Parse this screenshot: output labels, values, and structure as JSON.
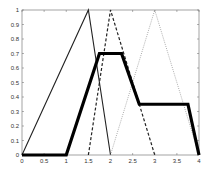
{
  "chart_data": {
    "type": "line",
    "title": "",
    "xlabel": "",
    "ylabel": "",
    "xlim": [
      0,
      4
    ],
    "ylim": [
      0,
      1
    ],
    "grid": false,
    "legend": null,
    "x_ticks": [
      "0",
      "0.5",
      "1",
      "1.5",
      "2",
      "2.5",
      "3",
      "3.5",
      "4"
    ],
    "y_ticks": [
      "0",
      "0.1",
      "0.2",
      "0.3",
      "0.4",
      "0.5",
      "0.6",
      "0.7",
      "0.8",
      "0.9",
      "1"
    ],
    "series": [
      {
        "name": "triangle-1",
        "style": "thin-solid",
        "x": [
          0,
          1.5,
          2
        ],
        "y": [
          0,
          1,
          0
        ]
      },
      {
        "name": "triangle-2",
        "style": "dashed",
        "x": [
          1.5,
          2,
          3
        ],
        "y": [
          0,
          1,
          0
        ]
      },
      {
        "name": "triangle-3",
        "style": "dotted",
        "x": [
          2,
          3,
          4
        ],
        "y": [
          0,
          1,
          0
        ]
      },
      {
        "name": "aggregate",
        "style": "thick-solid",
        "x": [
          0,
          1,
          1.75,
          2.25,
          2.65,
          3.75,
          4
        ],
        "y": [
          0,
          0,
          0.7,
          0.7,
          0.35,
          0.35,
          0
        ]
      }
    ]
  }
}
